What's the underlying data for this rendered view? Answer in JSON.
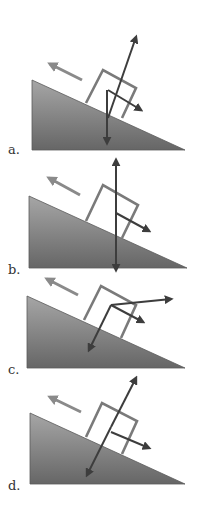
{
  "figure": {
    "colors": {
      "ramp_top": "#a6a6a6",
      "ramp_bottom": "#666666",
      "box_outline": "#7a7a7a",
      "motion_arrow": "#8a8a8a",
      "force_arrow": "#3d3d3d"
    },
    "panels": [
      {
        "label": "a.",
        "label_pos": [
          8,
          142
        ],
        "ramp": [
          [
            32,
            80
          ],
          [
            185,
            150
          ],
          [
            32,
            150
          ]
        ],
        "box": [
          [
            86,
            103
          ],
          [
            103,
            70
          ],
          [
            136,
            88
          ],
          [
            122,
            118
          ]
        ],
        "motion_arrow": {
          "from": [
            82,
            80
          ],
          "to": [
            50,
            64
          ]
        },
        "forces": [
          {
            "from": [
              108,
              118
            ],
            "to": [
              136,
              37
            ],
            "heads": "end"
          },
          {
            "from": [
              107,
              90
            ],
            "to": [
              107,
              143
            ],
            "heads": "end"
          },
          {
            "from": [
              108,
              90
            ],
            "to": [
              141,
              110
            ],
            "heads": "end"
          }
        ]
      },
      {
        "label": "b.",
        "label_pos": [
          8,
          262
        ],
        "ramp": [
          [
            29,
            196
          ],
          [
            187,
            268
          ],
          [
            29,
            268
          ]
        ],
        "box": [
          [
            86,
            221
          ],
          [
            103,
            185
          ],
          [
            138,
            205
          ],
          [
            122,
            238
          ]
        ],
        "motion_arrow": {
          "from": [
            80,
            195
          ],
          "to": [
            49,
            178
          ]
        },
        "forces": [
          {
            "from": [
              116,
              213
            ],
            "to": [
              116,
              160
            ],
            "heads": "end"
          },
          {
            "from": [
              116,
              213
            ],
            "to": [
              116,
              270
            ],
            "heads": "end"
          },
          {
            "from": [
              116,
              213
            ],
            "to": [
              149,
              231
            ],
            "heads": "end"
          }
        ]
      },
      {
        "label": "c.",
        "label_pos": [
          8,
          362
        ],
        "ramp": [
          [
            27,
            296
          ],
          [
            185,
            368
          ],
          [
            27,
            368
          ]
        ],
        "box": [
          [
            84,
            320
          ],
          [
            101,
            286
          ],
          [
            136,
            305
          ],
          [
            121,
            338
          ]
        ],
        "motion_arrow": {
          "from": [
            78,
            295
          ],
          "to": [
            47,
            279
          ]
        },
        "forces": [
          {
            "from": [
              111,
              305
            ],
            "to": [
              171,
              299
            ],
            "heads": "end"
          },
          {
            "from": [
              111,
              305
            ],
            "to": [
              143,
              322
            ],
            "heads": "end"
          },
          {
            "from": [
              111,
              305
            ],
            "to": [
              89,
              350
            ],
            "heads": "end"
          }
        ]
      },
      {
        "label": "d.",
        "label_pos": [
          8,
          478
        ],
        "ramp": [
          [
            30,
            413
          ],
          [
            185,
            484
          ],
          [
            30,
            484
          ]
        ],
        "box": [
          [
            86,
            437
          ],
          [
            102,
            403
          ],
          [
            137,
            421
          ],
          [
            122,
            454
          ]
        ],
        "motion_arrow": {
          "from": [
            81,
            412
          ],
          "to": [
            50,
            397
          ]
        },
        "forces": [
          {
            "from": [
              111,
              427
            ],
            "to": [
              136,
              378
            ],
            "heads": "end"
          },
          {
            "from": [
              111,
              427
            ],
            "to": [
              87,
              475
            ],
            "heads": "end"
          },
          {
            "from": [
              111,
              432
            ],
            "to": [
              149,
              448
            ],
            "heads": "end"
          }
        ]
      }
    ]
  }
}
